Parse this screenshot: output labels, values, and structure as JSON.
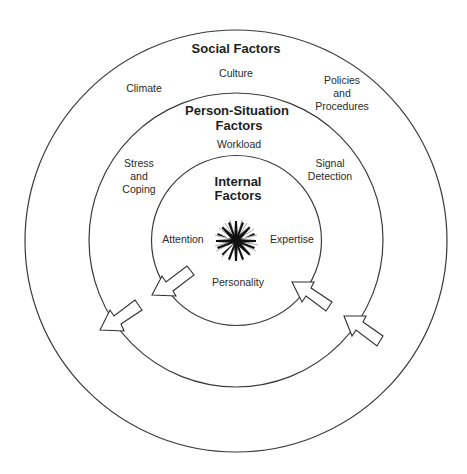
{
  "diagram": {
    "rings": [
      {
        "id": "social",
        "title": "Social Factors",
        "items": [
          {
            "lines": [
              "Climate"
            ]
          },
          {
            "lines": [
              "Culture"
            ]
          },
          {
            "lines": [
              "Policies",
              "and",
              "Procedures"
            ]
          }
        ]
      },
      {
        "id": "person-situation",
        "title_lines": [
          "Person-Situation",
          "Factors"
        ],
        "items": [
          {
            "lines": [
              "Workload"
            ]
          },
          {
            "lines": [
              "Stress",
              "and",
              "Coping"
            ]
          },
          {
            "lines": [
              "Signal",
              "Detection"
            ]
          }
        ]
      },
      {
        "id": "internal",
        "title_lines": [
          "Internal",
          "Factors"
        ],
        "items": [
          {
            "lines": [
              "Attention"
            ]
          },
          {
            "lines": [
              "Expertise"
            ]
          },
          {
            "lines": [
              "Personality"
            ]
          }
        ]
      }
    ],
    "arrows": [
      {
        "id": "internal-to-person-situation-left",
        "direction": "outward"
      },
      {
        "id": "person-situation-to-social-left",
        "direction": "outward"
      },
      {
        "id": "person-situation-to-internal-right",
        "direction": "inward"
      },
      {
        "id": "social-to-person-situation-right",
        "direction": "inward"
      }
    ],
    "center_icon": "starburst-icon",
    "colors": {
      "line": "#3a3a3a",
      "text": "#2a2a2a",
      "background": "#ffffff"
    }
  }
}
